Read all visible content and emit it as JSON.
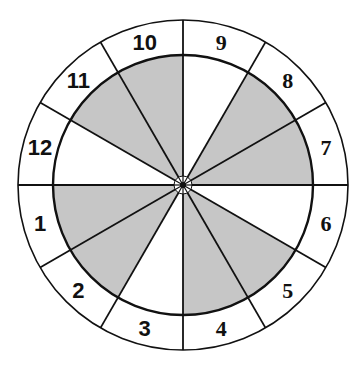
{
  "diagram": {
    "type": "segmented-wheel",
    "sector_count": 12,
    "colors": {
      "shade": "#c6c6c6",
      "line": "#111111",
      "background": "#ffffff"
    },
    "sectors": [
      {
        "label": "1",
        "shaded": true,
        "font": "sans"
      },
      {
        "label": "2",
        "shaded": true,
        "font": "sans"
      },
      {
        "label": "3",
        "shaded": false,
        "font": "sans"
      },
      {
        "label": "4",
        "shaded": true,
        "font": "serif"
      },
      {
        "label": "5",
        "shaded": true,
        "font": "serif"
      },
      {
        "label": "6",
        "shaded": false,
        "font": "serif"
      },
      {
        "label": "7",
        "shaded": true,
        "font": "serif"
      },
      {
        "label": "8",
        "shaded": true,
        "font": "serif"
      },
      {
        "label": "9",
        "shaded": false,
        "font": "serif"
      },
      {
        "label": "10",
        "shaded": true,
        "font": "sans"
      },
      {
        "label": "11",
        "shaded": true,
        "font": "sans"
      },
      {
        "label": "12",
        "shaded": false,
        "font": "sans"
      }
    ]
  }
}
